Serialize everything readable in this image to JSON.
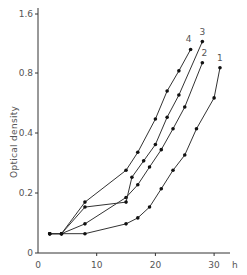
{
  "chart_data": {
    "type": "line",
    "title": "",
    "xlabel": "h",
    "ylabel": "Optical density",
    "yscale": "log2",
    "xlim": [
      0,
      33
    ],
    "ylim": [
      0.1,
      1.7
    ],
    "x_ticks": [
      0,
      10,
      20,
      30
    ],
    "x_tick_labels": [
      "0",
      "10",
      "20",
      "30"
    ],
    "y_ticks": [
      0.1,
      0.2,
      0.4,
      0.8,
      1.6
    ],
    "y_tick_labels": [
      "0",
      "0.2",
      "0.4",
      "0.8",
      "1.6"
    ],
    "grid": false,
    "legend": "inline labels at curve ends",
    "series": [
      {
        "name": "1",
        "x": [
          2,
          4,
          8,
          15,
          17,
          19,
          21,
          23,
          25,
          27,
          30,
          31
        ],
        "values": [
          0.125,
          0.125,
          0.125,
          0.14,
          0.15,
          0.17,
          0.21,
          0.26,
          0.31,
          0.42,
          0.6,
          0.85
        ]
      },
      {
        "name": "2",
        "x": [
          2,
          4,
          8,
          15,
          17,
          19,
          21,
          23,
          25,
          28
        ],
        "values": [
          0.125,
          0.125,
          0.14,
          0.19,
          0.22,
          0.27,
          0.33,
          0.42,
          0.54,
          0.9
        ]
      },
      {
        "name": "3",
        "x": [
          2,
          4,
          8,
          15,
          16,
          18,
          20,
          22,
          24,
          28
        ],
        "values": [
          0.125,
          0.125,
          0.17,
          0.18,
          0.24,
          0.29,
          0.35,
          0.48,
          0.62,
          1.15
        ]
      },
      {
        "name": "4",
        "x": [
          2,
          4,
          8,
          15,
          17,
          20,
          22,
          24,
          26
        ],
        "values": [
          0.125,
          0.125,
          0.18,
          0.26,
          0.32,
          0.47,
          0.65,
          0.82,
          1.05
        ]
      }
    ]
  },
  "labels": {
    "x_unit": "h",
    "y_axis": "Optical density"
  }
}
